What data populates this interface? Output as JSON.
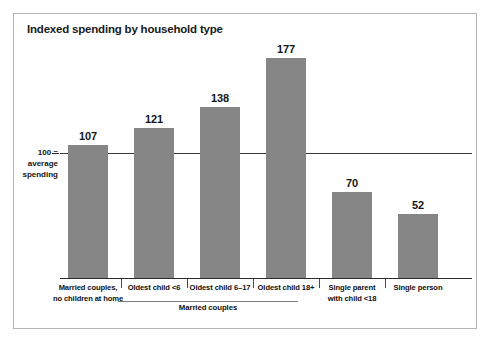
{
  "frame": {
    "border_color": "#b4b4b4"
  },
  "chart_data": {
    "type": "bar",
    "title": "Indexed spending by household type",
    "xlabel": "",
    "ylabel": "",
    "categories": [
      "Married couples, no children at home",
      "Oldest child <6",
      "Oldest child 6–17",
      "Oldest child 18+",
      "Single parent with child <18",
      "Single person"
    ],
    "category_lines": [
      [
        "Married couples,",
        "no children at home"
      ],
      [
        "Oldest child <6"
      ],
      [
        "Oldest child 6–17"
      ],
      [
        "Oldest child 18+"
      ],
      [
        "Single parent",
        "with child <18"
      ],
      [
        "Single person"
      ]
    ],
    "values": [
      107,
      121,
      138,
      177,
      70,
      52
    ],
    "ylim": [
      0,
      200
    ],
    "grid": false,
    "legend": null,
    "reference_line": {
      "value": 100,
      "label_lines": [
        "100 =",
        "average",
        "spending"
      ]
    },
    "group_bracket": {
      "label": "Married couples",
      "covers": [
        "Oldest child <6",
        "Oldest child 6–17",
        "Oldest child 18+"
      ]
    },
    "bar_color": "#868686",
    "axis_color": "#2b2b2b"
  }
}
